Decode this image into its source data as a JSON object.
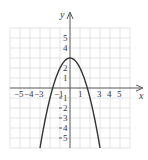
{
  "chart_data": {
    "type": "line",
    "title": "",
    "xlabel": "x",
    "ylabel": "y",
    "xlim": [
      -6,
      6
    ],
    "ylim": [
      -6,
      6
    ],
    "grid": true,
    "x_ticks": [
      "-5",
      "-4",
      "-3",
      "-1",
      "1",
      "3",
      "4",
      "5"
    ],
    "y_ticks": [
      "5",
      "4",
      "2",
      "1",
      "-1",
      "-2",
      "-3",
      "-4",
      "-5"
    ],
    "series": [
      {
        "name": "y = -x^2 + 3",
        "x": [
          -3,
          -2.5,
          -2,
          -1.5,
          -1,
          -0.5,
          0,
          0.5,
          1,
          1.5,
          2,
          2.5,
          3
        ],
        "values": [
          -6,
          -3.25,
          -1,
          0.75,
          2,
          2.75,
          3,
          2.75,
          2,
          0.75,
          -1,
          -3.25,
          -6
        ]
      }
    ],
    "annotations": {
      "vertex": [
        0,
        3
      ]
    }
  },
  "labels": {
    "x_axis": "x",
    "y_axis": "y",
    "xt": {
      "m5": "−5",
      "m4": "−4",
      "m3": "−3",
      "m1": "−1",
      "p1": "1",
      "p3": "3",
      "p4": "4",
      "p5": "5"
    },
    "yt": {
      "p5": "5",
      "p4": "4",
      "p2": "2",
      "p1": "1",
      "m1": "1",
      "m2": "2",
      "m3": "3",
      "m4": "4",
      "m5": "5"
    }
  },
  "colors": {
    "grid": "#dcdcdc",
    "axis": "#555555",
    "curve": "#333333"
  }
}
